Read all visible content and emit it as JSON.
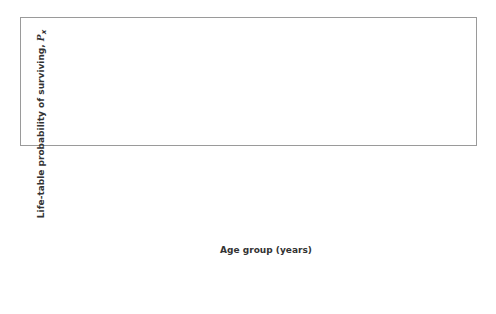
{
  "chart_data": {
    "type": "line",
    "title": "",
    "xlabel": "Age group (years)",
    "ylabel": "Life-table probability of surviving, P_x",
    "ylim": [
      0,
      1.0
    ],
    "yticks": [
      "0.0",
      "0.1",
      "0.2",
      "0.3",
      "0.4",
      "0.5",
      "0.6",
      "0.7",
      "0.8",
      "0.9",
      "1.0"
    ],
    "grid": true,
    "legend_position": "bottom",
    "categories": [
      "0",
      "1-4",
      "5-9",
      "10-14",
      "15-19",
      "20-24",
      "25-29",
      "30-34",
      "35-39",
      "40-44",
      "45-49",
      "50-54",
      "55-59",
      "60-64",
      "65-69",
      "70-74",
      "75-79",
      "80-84"
    ],
    "series": [
      {
        "name": "e0 = 45",
        "marker": "circle",
        "color": "#111111",
        "values": [
          1.0,
          0.87,
          0.79,
          0.75,
          0.73,
          0.72,
          0.7,
          0.68,
          0.65,
          0.61,
          0.57,
          0.53,
          0.48,
          0.42,
          0.35,
          0.27,
          0.19,
          0.11
        ]
      },
      {
        "name": "e0 = 40",
        "marker": "circle",
        "color": "#777777",
        "values": [
          1.0,
          0.86,
          0.77,
          0.73,
          0.71,
          0.7,
          0.68,
          0.64,
          0.59,
          0.53,
          0.47,
          0.41,
          0.35,
          0.31,
          0.26,
          0.21,
          0.14,
          0.08
        ]
      },
      {
        "name": "e0 = 35",
        "marker": "triangle",
        "color": "#111111",
        "values": [
          1.0,
          0.85,
          0.76,
          0.72,
          0.7,
          0.69,
          0.66,
          0.6,
          0.52,
          0.44,
          0.35,
          0.29,
          0.25,
          0.22,
          0.19,
          0.14,
          0.1,
          0.05
        ]
      },
      {
        "name": "e0 = 30",
        "marker": "square",
        "color": "#777777",
        "values": [
          1.0,
          0.84,
          0.74,
          0.7,
          0.68,
          0.67,
          0.63,
          0.56,
          0.43,
          0.31,
          0.22,
          0.16,
          0.14,
          0.12,
          0.1,
          0.08,
          0.06,
          0.03
        ]
      },
      {
        "name": "e0 = 25",
        "marker": "x",
        "color": "#111111",
        "values": [
          1.0,
          0.83,
          0.72,
          0.68,
          0.66,
          0.65,
          0.6,
          0.49,
          0.3,
          0.17,
          0.09,
          0.06,
          0.05,
          0.04,
          0.04,
          0.03,
          0.02,
          0.01
        ]
      }
    ]
  },
  "legend": [
    {
      "symbol": "e",
      "sub": "0",
      "text": " = 45"
    },
    {
      "symbol": "e",
      "sub": "0",
      "text": " = 40"
    },
    {
      "symbol": "e",
      "sub": "0",
      "text": " = 35"
    },
    {
      "symbol": "e",
      "sub": "0",
      "text": " = 30"
    },
    {
      "symbol": "e",
      "sub": "0",
      "text": " = 25"
    }
  ]
}
